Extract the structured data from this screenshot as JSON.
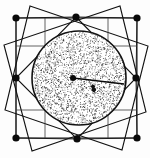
{
  "figure": {
    "title": "Stippled circle inscribed in square lattice with rotated square interlace",
    "type": "geometric-diagram",
    "width": 150,
    "height": 158,
    "background_color": "#fdfdfd",
    "ink_color": "#111111",
    "stipple_color": "#1a1a1a"
  },
  "outer_square": {
    "label": "outer bounding square",
    "left": 16,
    "top": 18,
    "right": 137,
    "bottom": 138,
    "stroke_width": 1.0
  },
  "grid": {
    "label": "internal cross grid lines",
    "vertical_x": [
      45,
      108
    ],
    "horizontal_y": [
      46,
      110
    ],
    "stroke_width": 0.8
  },
  "nodes": {
    "label": "black node dots",
    "radius": 3.6,
    "color": "#0a0a0a",
    "points": [
      {
        "name": "corner-top-left",
        "x": 16,
        "y": 18
      },
      {
        "name": "edge-top-mid",
        "x": 76,
        "y": 17
      },
      {
        "name": "corner-top-right",
        "x": 137,
        "y": 18
      },
      {
        "name": "edge-left-mid",
        "x": 16,
        "y": 78
      },
      {
        "name": "edge-right-mid",
        "x": 136,
        "y": 78
      },
      {
        "name": "corner-bottom-left",
        "x": 16,
        "y": 138
      },
      {
        "name": "edge-bottom-mid",
        "x": 77,
        "y": 139
      },
      {
        "name": "corner-bottom-right",
        "x": 137,
        "y": 138
      }
    ]
  },
  "circle": {
    "label": "stippled disc",
    "center_x": 79,
    "center_y": 78,
    "radius": 47,
    "stroke_width": 1.6,
    "fill": "stipple-texture",
    "stipple_density": 2600
  },
  "center_marker": {
    "label": "centre dot",
    "x": 73,
    "y": 78,
    "radius": 3.0,
    "color": "#0a0a0a"
  },
  "radius_line": {
    "label": "radius vector to circle edge",
    "x1": 73,
    "y1": 78,
    "x2": 124,
    "y2": 84,
    "stroke_width": 1.3
  },
  "inner_blob": {
    "label": "small dark cluster marker",
    "x": 93,
    "y": 88,
    "size": 5
  },
  "rotated_squares": [
    {
      "name": "rotated-square-a",
      "vertices": [
        [
          76,
          17
        ],
        [
          136,
          78
        ],
        [
          77,
          139
        ],
        [
          16,
          78
        ]
      ],
      "stroke_width": 1.1
    },
    {
      "name": "rotated-square-b",
      "vertices": [
        [
          30,
          6
        ],
        [
          148,
          46
        ],
        [
          122,
          150
        ],
        [
          5,
          110
        ]
      ],
      "stroke_width": 1.1
    },
    {
      "name": "rotated-square-c",
      "vertices": [
        [
          120,
          6
        ],
        [
          146,
          112
        ],
        [
          32,
          151
        ],
        [
          4,
          45
        ]
      ],
      "stroke_width": 1.1
    }
  ],
  "star_chords": {
    "label": "interlace chord segments",
    "segments": [
      [
        [
          16,
          18
        ],
        [
          76,
          17
        ]
      ],
      [
        [
          76,
          17
        ],
        [
          137,
          18
        ]
      ],
      [
        [
          16,
          18
        ],
        [
          16,
          78
        ]
      ],
      [
        [
          16,
          78
        ],
        [
          16,
          138
        ]
      ],
      [
        [
          137,
          18
        ],
        [
          136,
          78
        ]
      ],
      [
        [
          136,
          78
        ],
        [
          137,
          138
        ]
      ],
      [
        [
          16,
          138
        ],
        [
          77,
          139
        ]
      ],
      [
        [
          77,
          139
        ],
        [
          137,
          138
        ]
      ]
    ]
  }
}
